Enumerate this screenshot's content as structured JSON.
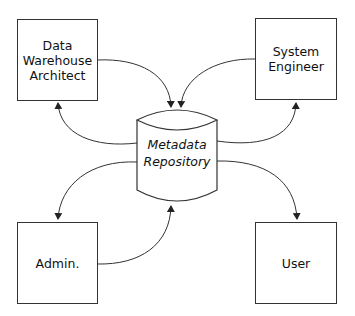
{
  "diagram": {
    "type": "metadata-flow",
    "central_node": {
      "label": "Metadata\nRepository",
      "shape": "cylinder"
    },
    "nodes": [
      {
        "id": "dwa",
        "label": "Data\nWarehouse\nArchitect",
        "position": "top-left"
      },
      {
        "id": "se",
        "label": "System\nEngineer",
        "position": "top-right"
      },
      {
        "id": "admin",
        "label": "Admin.",
        "position": "bottom-left"
      },
      {
        "id": "user",
        "label": "User",
        "position": "bottom-right"
      }
    ],
    "edges": [
      {
        "from": "Data Warehouse Architect",
        "to": "Metadata Repository"
      },
      {
        "from": "Metadata Repository",
        "to": "Data Warehouse Architect"
      },
      {
        "from": "System Engineer",
        "to": "Metadata Repository"
      },
      {
        "from": "Metadata Repository",
        "to": "System Engineer"
      },
      {
        "from": "Metadata Repository",
        "to": "Admin."
      },
      {
        "from": "Admin.",
        "to": "Metadata Repository"
      },
      {
        "from": "Metadata Repository",
        "to": "User"
      }
    ],
    "colors": {
      "stroke": "#333333",
      "background": "#ffffff"
    }
  }
}
